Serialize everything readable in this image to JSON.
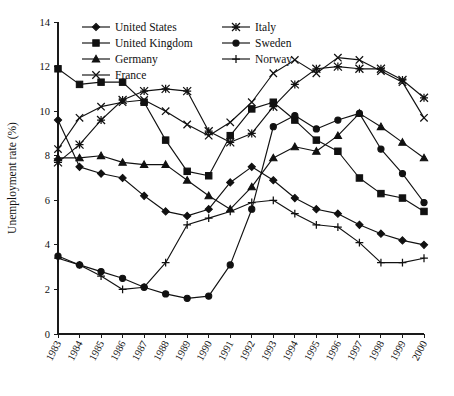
{
  "chart_data": {
    "type": "line",
    "title": "",
    "xlabel": "",
    "ylabel": "Unemployment rate (%)",
    "xlim": [
      1983,
      2000
    ],
    "ylim": [
      0,
      14
    ],
    "yticks": [
      0,
      2,
      4,
      6,
      8,
      10,
      12,
      14
    ],
    "grid": false,
    "legend_position": "top-center",
    "legend_columns": 2,
    "x": [
      1983,
      1984,
      1985,
      1986,
      1987,
      1988,
      1989,
      1990,
      1991,
      1992,
      1993,
      1994,
      1995,
      1996,
      1997,
      1998,
      1999,
      2000
    ],
    "categories": [
      "1983",
      "1984",
      "1985",
      "1986",
      "1987",
      "1988",
      "1989",
      "1990",
      "1991",
      "1992",
      "1993",
      "1994",
      "1995",
      "1996",
      "1997",
      "1998",
      "1999",
      "2000"
    ],
    "series": [
      {
        "name": "United States",
        "marker": "diamond",
        "values": [
          9.6,
          7.5,
          7.2,
          7.0,
          6.2,
          5.5,
          5.3,
          5.6,
          6.8,
          7.5,
          6.9,
          6.1,
          5.6,
          5.4,
          4.9,
          4.5,
          4.2,
          4.0
        ]
      },
      {
        "name": "United Kingdom",
        "marker": "square",
        "values": [
          11.9,
          11.2,
          11.3,
          11.3,
          10.4,
          8.7,
          7.3,
          7.1,
          8.9,
          10.1,
          10.4,
          9.6,
          8.7,
          8.2,
          7.0,
          6.3,
          6.1,
          5.5
        ]
      },
      {
        "name": "Germany",
        "marker": "triangle",
        "values": [
          7.9,
          7.9,
          8.0,
          7.7,
          7.6,
          7.6,
          6.9,
          6.2,
          5.6,
          6.6,
          7.9,
          8.4,
          8.2,
          8.9,
          9.9,
          9.3,
          8.6,
          7.9
        ]
      },
      {
        "name": "France",
        "marker": "cross-x",
        "values": [
          8.3,
          9.7,
          10.2,
          10.4,
          10.5,
          10.0,
          9.4,
          8.9,
          9.5,
          10.4,
          11.7,
          12.3,
          11.7,
          12.4,
          12.3,
          11.8,
          11.3,
          9.7
        ]
      },
      {
        "name": "Italy",
        "marker": "star-x",
        "values": [
          7.7,
          8.5,
          9.6,
          10.5,
          10.9,
          11.0,
          10.9,
          9.1,
          8.6,
          9.0,
          10.2,
          11.2,
          11.9,
          12.0,
          11.9,
          11.9,
          11.4,
          10.6
        ]
      },
      {
        "name": "Sweden",
        "marker": "circle",
        "values": [
          3.5,
          3.1,
          2.8,
          2.5,
          2.1,
          1.8,
          1.6,
          1.7,
          3.1,
          5.6,
          9.3,
          9.8,
          9.2,
          9.6,
          9.9,
          8.3,
          7.2,
          5.9
        ]
      },
      {
        "name": "Norway",
        "marker": "plus",
        "values": [
          3.4,
          3.1,
          2.6,
          2.0,
          2.1,
          3.2,
          4.9,
          5.2,
          5.5,
          5.9,
          6.0,
          5.4,
          4.9,
          4.8,
          4.1,
          3.2,
          3.2,
          3.4
        ]
      }
    ]
  },
  "axis": {
    "y_title": "Unemployment rate (%)"
  },
  "legend": {
    "entries": [
      {
        "label": "United States",
        "marker": "diamond"
      },
      {
        "label": "Italy",
        "marker": "star-x"
      },
      {
        "label": "United Kingdom",
        "marker": "square"
      },
      {
        "label": "Sweden",
        "marker": "circle"
      },
      {
        "label": "Germany",
        "marker": "triangle"
      },
      {
        "label": "Norway",
        "marker": "plus"
      },
      {
        "label": "France",
        "marker": "cross-x"
      }
    ]
  },
  "colors": {
    "ink": "#111111",
    "background": "#ffffff"
  }
}
